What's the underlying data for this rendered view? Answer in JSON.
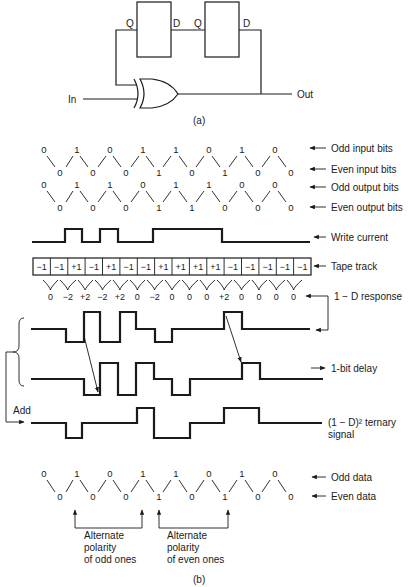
{
  "figure_a": {
    "caption": "(a)",
    "flipflop1": {
      "left_pin": "Q",
      "right_pin": "D"
    },
    "flipflop2": {
      "left_pin": "Q",
      "right_pin": "D"
    },
    "input_label": "In",
    "output_label": "Out",
    "gate": "xor-gate"
  },
  "figure_b": {
    "caption": "(b)",
    "rows": {
      "odd_input": {
        "label": "Odd input bits",
        "bits": [
          "0",
          "1",
          "0",
          "1",
          "1",
          "0",
          "1",
          "0"
        ]
      },
      "even_input": {
        "label": "Even input bits",
        "bits": [
          "0",
          "0",
          "0",
          "1",
          "0",
          "1",
          "0",
          "0"
        ]
      },
      "odd_output": {
        "label": "Odd output bits",
        "bits": [
          "0",
          "1",
          "1",
          "0",
          "1",
          "1",
          "0",
          "0"
        ]
      },
      "even_output": {
        "label": "Even output bits",
        "bits": [
          "0",
          "0",
          "0",
          "1",
          "1",
          "0",
          "0",
          "0"
        ]
      },
      "write_current": {
        "label": "Write current"
      },
      "tape_track": {
        "label": "Tape track",
        "cells": [
          "−1",
          "−1",
          "+1",
          "−1",
          "+1",
          "−1",
          "−1",
          "+1",
          "+1",
          "+1",
          "+1",
          "−1",
          "−1",
          "−1",
          "−1",
          "−1"
        ]
      },
      "response": {
        "label": "1 − D response",
        "values": [
          "0",
          "−2",
          "+2",
          "−2",
          "+2",
          "0",
          "−2",
          "0",
          "0",
          "0",
          "+2",
          "0",
          "0",
          "0",
          "0"
        ]
      },
      "delay": {
        "label": "1-bit delay"
      },
      "add_label": "Add",
      "ternary": {
        "label_line1": "(1 − D)² ternary",
        "label_line2": "signal"
      },
      "odd_data": {
        "label": "Odd data",
        "bits": [
          "0",
          "1",
          "0",
          "1",
          "1",
          "0",
          "1",
          "0"
        ]
      },
      "even_data": {
        "label": "Even data",
        "bits": [
          "0",
          "0",
          "0",
          "1",
          "0",
          "1",
          "0",
          "0"
        ]
      }
    },
    "annotations": {
      "odd_ones": [
        "Alternate",
        "polarity",
        "of odd ones"
      ],
      "even_ones": [
        "Alternate",
        "polarity",
        "of even ones"
      ]
    }
  }
}
